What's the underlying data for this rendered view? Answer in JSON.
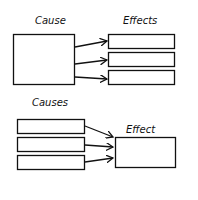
{
  "diagram_one": {
    "cause_label": "Cause",
    "effects_label": "Effects"
  },
  "diagram_two": {
    "causes_label": "Causes",
    "effect_label": "Effect"
  }
}
